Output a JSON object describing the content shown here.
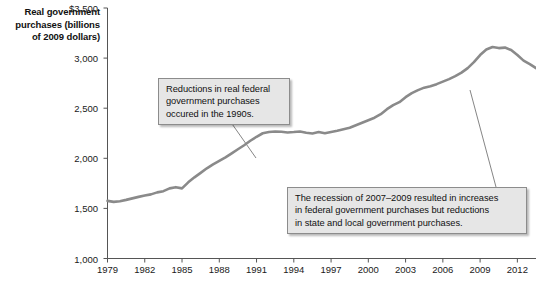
{
  "chart_data": {
    "type": "line",
    "title": "",
    "subtitle": "",
    "xlabel": "",
    "ylabel": "Real government purchases (billions of 2009 dollars)",
    "xlim": [
      1979,
      2013.5
    ],
    "ylim": [
      1000,
      3500
    ],
    "grid": false,
    "legend": "none",
    "line_color": "#8a8a8a",
    "y_ticks": [
      "$3,500",
      "3,000",
      "2,500",
      "2,000",
      "1,500",
      "1,000"
    ],
    "y_tick_values": [
      3500,
      3000,
      2500,
      2000,
      1500,
      1000
    ],
    "x_ticks": [
      "1979",
      "1982",
      "1985",
      "1988",
      "1991",
      "1994",
      "1997",
      "2000",
      "2003",
      "2006",
      "2009",
      "2012"
    ],
    "x_tick_values": [
      1979,
      1982,
      1985,
      1988,
      1991,
      1994,
      1997,
      2000,
      2003,
      2006,
      2009,
      2012
    ],
    "series": [
      {
        "name": "Real government purchases",
        "x": [
          1979,
          1979.5,
          1980,
          1980.5,
          1981,
          1981.5,
          1982,
          1982.5,
          1983,
          1983.5,
          1984,
          1984.5,
          1985,
          1985.5,
          1986,
          1986.5,
          1987,
          1987.5,
          1988,
          1988.5,
          1989,
          1989.5,
          1990,
          1990.5,
          1991,
          1991.5,
          1992,
          1992.5,
          1993,
          1993.5,
          1994,
          1994.5,
          1995,
          1995.5,
          1996,
          1996.5,
          1997,
          1997.5,
          1998,
          1998.5,
          1999,
          1999.5,
          2000,
          2000.5,
          2001,
          2001.5,
          2002,
          2002.5,
          2003,
          2003.5,
          2004,
          2004.5,
          2005,
          2005.5,
          2006,
          2006.5,
          2007,
          2007.5,
          2008,
          2008.5,
          2009,
          2009.5,
          2010,
          2010.5,
          2011,
          2011.5,
          2012,
          2012.5,
          2013,
          2013.5
        ],
        "y": [
          1575,
          1565,
          1572,
          1585,
          1600,
          1615,
          1628,
          1640,
          1660,
          1672,
          1700,
          1712,
          1700,
          1760,
          1810,
          1855,
          1900,
          1940,
          1975,
          2010,
          2050,
          2090,
          2130,
          2175,
          2215,
          2250,
          2262,
          2268,
          2265,
          2258,
          2262,
          2268,
          2255,
          2248,
          2262,
          2250,
          2262,
          2275,
          2290,
          2305,
          2330,
          2355,
          2380,
          2405,
          2440,
          2490,
          2530,
          2560,
          2610,
          2650,
          2680,
          2705,
          2720,
          2740,
          2765,
          2790,
          2820,
          2855,
          2900,
          2960,
          3030,
          3085,
          3110,
          3100,
          3105,
          3080,
          3030,
          2975,
          2940,
          2900
        ]
      }
    ],
    "annotations": [
      {
        "id": "callout-1990s",
        "lines": [
          "Reductions in real federal",
          "government purchases",
          "occured in the 1990s."
        ],
        "leader_from": [
          230,
          121
        ],
        "leader_to": [
          256,
          158
        ]
      },
      {
        "id": "callout-recession",
        "lines": [
          "The recession of 2007–2009 resulted in increases",
          "in federal government purchases but reductions",
          "in state and local government purchases."
        ],
        "leader_from": [
          496,
          187
        ],
        "leader_to": [
          470,
          90
        ]
      }
    ]
  },
  "axis": {
    "ylabel_line1": "Real government",
    "ylabel_line2": "purchases (billions",
    "ylabel_line3": "of 2009 dollars)"
  }
}
